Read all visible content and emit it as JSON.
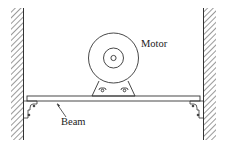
{
  "diagram": {
    "type": "mechanical-schematic",
    "labels": {
      "motor": "Motor",
      "beam": "Beam"
    },
    "components": [
      "left-wall",
      "right-wall",
      "beam",
      "motor",
      "motor-mount",
      "left-bracket",
      "right-bracket"
    ],
    "colors": {
      "line": "#333333",
      "background": "#ffffff"
    }
  }
}
